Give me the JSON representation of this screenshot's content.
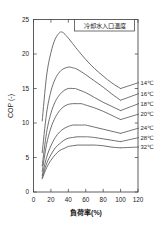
{
  "chart_data": {
    "type": "line",
    "title": "",
    "xlabel": "負荷率(%)",
    "ylabel": "COP (-)",
    "xlim": [
      0,
      120
    ],
    "ylim": [
      0,
      25
    ],
    "xticks": [
      0,
      20,
      40,
      60,
      80,
      100,
      120
    ],
    "yticks": [
      0,
      5,
      10,
      15,
      20,
      25
    ],
    "grid": false,
    "legend_title": "冷却水入口温度",
    "legend_position": "right-of-curve-ends",
    "series": [
      {
        "name": "14℃",
        "x": [
          10,
          15,
          20,
          25,
          30,
          32,
          35,
          40,
          45,
          50,
          60,
          70,
          80,
          90,
          100
        ],
        "values": [
          10.3,
          16.8,
          20.2,
          22.2,
          23.1,
          23.2,
          23.0,
          22.3,
          21.5,
          20.7,
          19.2,
          17.9,
          16.8,
          15.8,
          15.0
        ]
      },
      {
        "name": "16℃",
        "x": [
          10,
          15,
          20,
          25,
          30,
          35,
          40,
          42,
          45,
          50,
          60,
          70,
          80,
          90,
          100
        ],
        "values": [
          5.7,
          11.4,
          14.6,
          16.4,
          17.4,
          17.9,
          18.1,
          18.1,
          18.0,
          17.8,
          17.0,
          16.1,
          15.2,
          14.2,
          13.3
        ]
      },
      {
        "name": "18℃",
        "x": [
          10,
          15,
          20,
          25,
          30,
          35,
          40,
          45,
          48,
          50,
          60,
          70,
          80,
          90,
          100
        ],
        "values": [
          3.8,
          8.6,
          11.4,
          13.1,
          14.1,
          14.7,
          15.0,
          15.0,
          15.0,
          14.9,
          14.4,
          13.7,
          13.0,
          12.4,
          11.8
        ]
      },
      {
        "name": "20℃",
        "x": [
          10,
          15,
          20,
          25,
          30,
          35,
          40,
          45,
          50,
          52,
          55,
          60,
          70,
          80,
          90,
          100
        ],
        "values": [
          3.0,
          6.9,
          9.3,
          10.8,
          11.8,
          12.4,
          12.7,
          12.8,
          12.8,
          12.8,
          12.8,
          12.6,
          12.2,
          11.7,
          11.1,
          10.5
        ]
      },
      {
        "name": "24℃",
        "x": [
          10,
          15,
          20,
          25,
          30,
          35,
          40,
          45,
          50,
          55,
          58,
          60,
          70,
          80,
          90,
          100
        ],
        "values": [
          2.4,
          5.0,
          6.7,
          7.9,
          8.7,
          9.2,
          9.5,
          9.7,
          9.7,
          9.7,
          9.7,
          9.7,
          9.4,
          9.1,
          8.8,
          8.5
        ]
      },
      {
        "name": "28℃",
        "x": [
          10,
          15,
          20,
          25,
          30,
          35,
          40,
          45,
          50,
          55,
          60,
          62,
          70,
          80,
          90,
          100
        ],
        "values": [
          2.1,
          4.1,
          5.4,
          6.4,
          7.0,
          7.5,
          7.8,
          7.9,
          8.0,
          8.0,
          8.0,
          8.0,
          7.9,
          7.7,
          7.5,
          7.3
        ]
      },
      {
        "name": "32℃",
        "x": [
          10,
          15,
          20,
          25,
          30,
          35,
          40,
          45,
          50,
          55,
          60,
          65,
          70,
          80,
          90,
          100
        ],
        "values": [
          1.9,
          3.5,
          4.6,
          5.4,
          6.0,
          6.3,
          6.6,
          6.7,
          6.8,
          6.8,
          6.8,
          6.8,
          6.8,
          6.7,
          6.5,
          6.4
        ]
      }
    ]
  },
  "axes": {
    "y_title": "COP (-)",
    "x_title": "負荷率(%)",
    "x_tick_labels": [
      "0",
      "20",
      "40",
      "60",
      "80",
      "100",
      "120"
    ],
    "y_tick_labels": [
      "0",
      "5",
      "10",
      "15",
      "20",
      "25"
    ]
  },
  "legend": {
    "title": "冷却水入口温度",
    "labels": [
      "14℃",
      "16℃",
      "18℃",
      "20℃",
      "24℃",
      "28℃",
      "32℃"
    ]
  },
  "colors": {
    "curve": "#555555",
    "axis": "#4d4d4d",
    "background": "#ffffff",
    "text": "#1a1a1a"
  }
}
